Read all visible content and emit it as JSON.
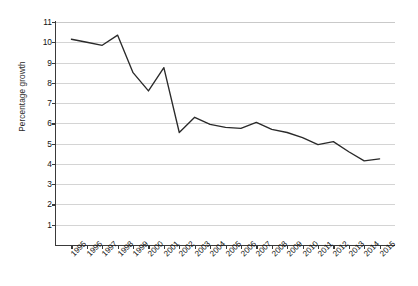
{
  "chart_data": {
    "type": "line",
    "title": "",
    "subtitle": "",
    "xlabel": "",
    "ylabel": "Percentage growth",
    "categories": [
      "1995",
      "1996",
      "1997",
      "1998",
      "1999",
      "2000",
      "2001",
      "2002",
      "2003",
      "2004",
      "2005",
      "2006",
      "2007",
      "2008",
      "2009",
      "2010",
      "2011",
      "2012",
      "2013",
      "2014",
      "2015"
    ],
    "values": [
      10.15,
      10.0,
      9.85,
      10.35,
      8.5,
      7.6,
      8.75,
      5.55,
      6.3,
      5.95,
      5.8,
      5.75,
      6.05,
      5.7,
      5.55,
      5.3,
      4.95,
      5.1,
      4.6,
      4.15,
      4.25
    ],
    "series": [
      {
        "name": "",
        "values": [
          10.15,
          10.0,
          9.85,
          10.35,
          8.5,
          7.6,
          8.75,
          5.55,
          6.3,
          5.95,
          5.8,
          5.75,
          6.05,
          5.7,
          5.55,
          5.3,
          4.95,
          5.1,
          4.6,
          4.15,
          4.25
        ],
        "color": "#2a2a2a"
      }
    ],
    "ylim": [
      0,
      11
    ],
    "yticks": [
      11,
      10,
      9,
      8,
      7,
      6,
      5,
      4,
      3,
      2,
      1
    ],
    "ytick_labels": [
      "11",
      "10",
      "9",
      "8",
      "7",
      "6",
      "5",
      "4",
      "3",
      "2",
      "1"
    ],
    "xtick_labels": [
      "1995",
      "1996",
      "1997",
      "1998",
      "1999",
      "2000",
      "2001",
      "2002",
      "2003",
      "2004",
      "2005",
      "2006",
      "2007",
      "2008",
      "2009",
      "2010",
      "2011",
      "2012",
      "2013",
      "2014",
      "2015"
    ],
    "grid": "horizontal",
    "gridline_color": "#d4d4d4",
    "legend": "none",
    "axis_color": "#3a3a3a",
    "background": "#ffffff",
    "annotations": []
  }
}
